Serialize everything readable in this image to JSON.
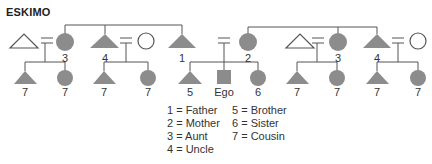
{
  "title": "ESKIMO",
  "colors": {
    "fill": "#8c8c8c",
    "line": "#555555",
    "text": "#333333"
  },
  "top_generation": [
    {
      "id": "uncle-by-marriage-left",
      "shape": "triangle",
      "filled": false,
      "label": ""
    },
    {
      "id": "aunt-left",
      "shape": "circle",
      "filled": true,
      "label": "3"
    },
    {
      "id": "uncle-left",
      "shape": "triangle",
      "filled": true,
      "label": "4"
    },
    {
      "id": "aunt-by-marriage-left",
      "shape": "circle",
      "filled": false,
      "label": ""
    },
    {
      "id": "father",
      "shape": "triangle",
      "filled": true,
      "label": "1"
    },
    {
      "id": "mother",
      "shape": "circle",
      "filled": true,
      "label": "2"
    },
    {
      "id": "uncle-by-marriage-right",
      "shape": "triangle",
      "filled": false,
      "label": ""
    },
    {
      "id": "aunt-right",
      "shape": "circle",
      "filled": true,
      "label": "3"
    },
    {
      "id": "uncle-right",
      "shape": "triangle",
      "filled": true,
      "label": "4"
    },
    {
      "id": "aunt-by-marriage-right",
      "shape": "circle",
      "filled": false,
      "label": ""
    }
  ],
  "children_generation": [
    {
      "shape": "triangle",
      "label": "7"
    },
    {
      "shape": "circle",
      "label": "7"
    },
    {
      "shape": "triangle",
      "label": "7"
    },
    {
      "shape": "circle",
      "label": "7"
    },
    {
      "shape": "triangle",
      "label": "5"
    },
    {
      "shape": "square",
      "label": "Ego"
    },
    {
      "shape": "circle",
      "label": "6"
    },
    {
      "shape": "triangle",
      "label": "7"
    },
    {
      "shape": "circle",
      "label": "7"
    },
    {
      "shape": "triangle",
      "label": "7"
    },
    {
      "shape": "circle",
      "label": "7"
    }
  ],
  "legend": {
    "left": [
      "1 = Father",
      "2 = Mother",
      "3 = Aunt",
      "4 = Uncle"
    ],
    "right": [
      "5 = Brother",
      "6 = Sister",
      "7 = Cousin"
    ]
  }
}
